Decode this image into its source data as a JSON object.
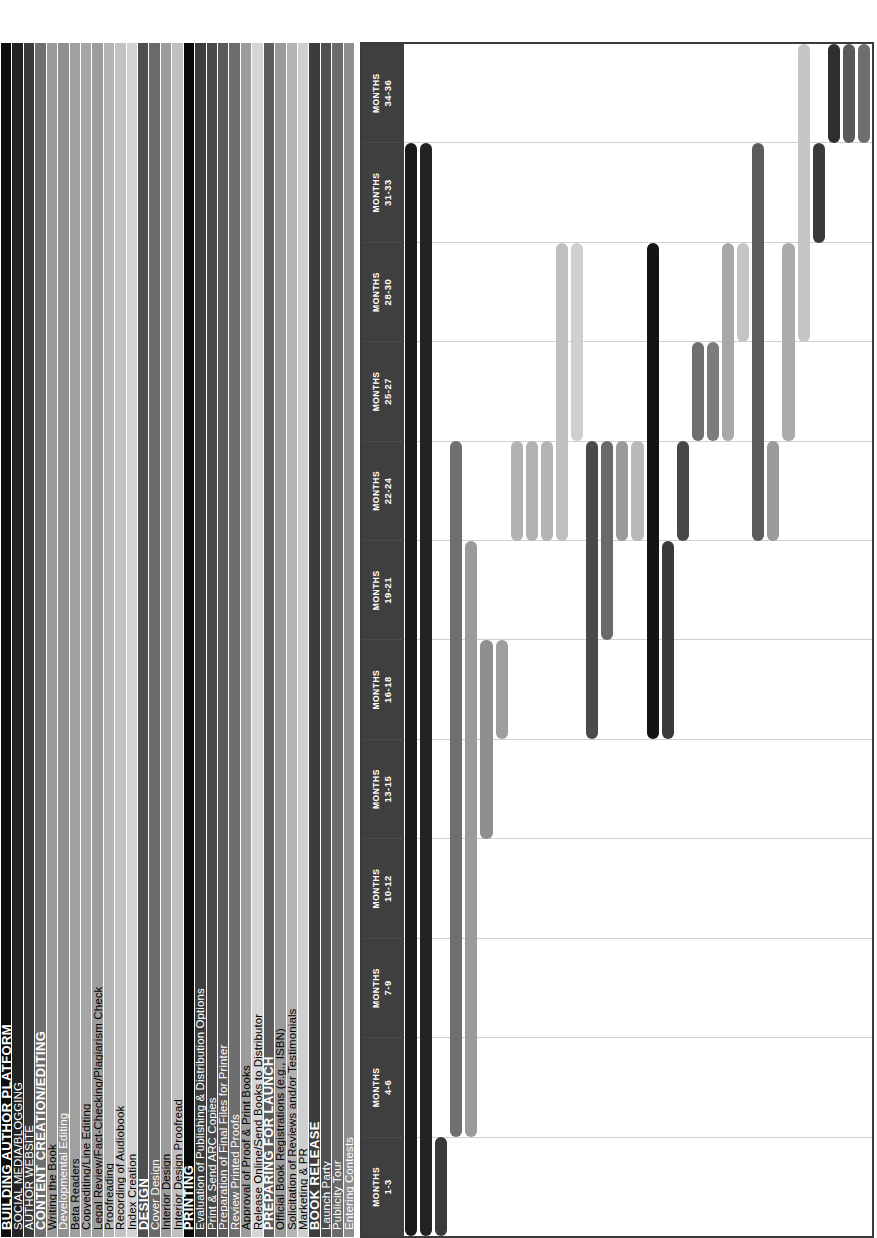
{
  "chart_data": {
    "type": "bar",
    "subtype": "gantt",
    "title": "",
    "xlabel": "",
    "ylabel": "",
    "grid": true,
    "legend": "none",
    "x_unit": "quarter",
    "x_range": [
      1,
      12
    ],
    "categories": [
      "MONTHS 1-3",
      "MONTHS 4-6",
      "MONTHS 7-9",
      "MONTHS 10-12",
      "MONTHS 13-15",
      "MONTHS 16-18",
      "MONTHS 19-21",
      "MONTHS 22-24",
      "MONTHS 25-27",
      "MONTHS 28-30",
      "MONTHS 31-33",
      "MONTHS 34-36"
    ],
    "column_headers": [
      {
        "line1": "MONTHS",
        "line2": "1-3"
      },
      {
        "line1": "MONTHS",
        "line2": "4-6"
      },
      {
        "line1": "MONTHS",
        "line2": "7-9"
      },
      {
        "line1": "MONTHS",
        "line2": "10-12"
      },
      {
        "line1": "MONTHS",
        "line2": "13-15"
      },
      {
        "line1": "MONTHS",
        "line2": "16-18"
      },
      {
        "line1": "MONTHS",
        "line2": "19-21"
      },
      {
        "line1": "MONTHS",
        "line2": "22-24"
      },
      {
        "line1": "MONTHS",
        "line2": "25-27"
      },
      {
        "line1": "MONTHS",
        "line2": "28-30"
      },
      {
        "line1": "MONTHS",
        "line2": "31-33"
      },
      {
        "line1": "MONTHS",
        "line2": "34-36"
      }
    ],
    "tasks": [
      {
        "label": "BUILDING AUTHOR PLATFORM",
        "phase": true,
        "label_bg": "#0d0d0d",
        "bar_color": "#1a1a1a",
        "start": 1,
        "end": 12
      },
      {
        "label": "SOCIAL MEDIA/BLOGGING",
        "phase": false,
        "label_bg": "#232323",
        "bar_color": "#232323",
        "start": 1,
        "end": 12
      },
      {
        "label": "AUTHOR WEBSITE",
        "phase": false,
        "label_bg": "#3a3a3a",
        "bar_color": "#3a3a3a",
        "start": 1,
        "end": 2
      },
      {
        "label": "CONTENT CREATION/EDITING",
        "phase": true,
        "label_bg": "#6f6f6f",
        "bar_color": "#6f6f6f",
        "start": 2,
        "end": 9
      },
      {
        "label": "Writing the Book",
        "phase": false,
        "label_bg": "#9b9b9b",
        "bar_color": "#9b9b9b",
        "start": 2,
        "end": 8
      },
      {
        "label": "Developmental Editing",
        "phase": false,
        "label_bg": "#8f8f8f",
        "bar_color": "#8f8f8f",
        "start": 5,
        "end": 7
      },
      {
        "label": "Beta Readers",
        "phase": false,
        "label_bg": "#a0a0a0",
        "bar_color": "#9e9e9e",
        "start": 6,
        "end": 7
      },
      {
        "label": "Copyediting/Line Editing",
        "phase": false,
        "label_bg": "#a6a6a6",
        "bar_color": "#b2b2b2",
        "start": 8,
        "end": 9
      },
      {
        "label": "Legal Review/Fact-Checking/Plagiarism Check",
        "phase": false,
        "label_bg": "#9d9d9d",
        "bar_color": "#b2b2b2",
        "start": 8,
        "end": 9
      },
      {
        "label": "Proofreading",
        "phase": false,
        "label_bg": "#b4b4b4",
        "bar_color": "#b4b4b4",
        "start": 8,
        "end": 9
      },
      {
        "label": "Recording of Audiobook",
        "phase": false,
        "label_bg": "#c2c2c2",
        "bar_color": "#c0c0c0",
        "start": 8,
        "end": 11
      },
      {
        "label": "Index Creation",
        "phase": false,
        "label_bg": "#d2d2d2",
        "bar_color": "#cfcfcf",
        "start": 9,
        "end": 11
      },
      {
        "label": "DESIGN",
        "phase": true,
        "label_bg": "#4e4e4e",
        "bar_color": "#4a4a4a",
        "start": 6,
        "end": 9
      },
      {
        "label": "Cover Design",
        "phase": false,
        "label_bg": "#6a6a6a",
        "bar_color": "#6a6a6a",
        "start": 7,
        "end": 9
      },
      {
        "label": "Interior Design",
        "phase": false,
        "label_bg": "#9c9c9c",
        "bar_color": "#9a9a9a",
        "start": 8,
        "end": 9
      },
      {
        "label": "Interior Design Proofread",
        "phase": false,
        "label_bg": "#c0c0c0",
        "bar_color": "#b9b9b9",
        "start": 8,
        "end": 9
      },
      {
        "label": "PRINTING",
        "phase": true,
        "label_bg": "#0a0a0a",
        "bar_color": "#141414",
        "start": 6,
        "end": 11
      },
      {
        "label": "Evaluation of Publishing & Distribution Options",
        "phase": false,
        "label_bg": "#3d3d3d",
        "bar_color": "#3a3a3a",
        "start": 6,
        "end": 8
      },
      {
        "label": "Print & Send ARC Copies",
        "phase": false,
        "label_bg": "#4a4a4a",
        "bar_color": "#474747",
        "start": 8,
        "end": 9
      },
      {
        "label": "Preparation of Final Files for Printer",
        "phase": false,
        "label_bg": "#5a5a5a",
        "bar_color": "#6f6f6f",
        "start": 9,
        "end": 10
      },
      {
        "label": "Review Printed Proofs",
        "phase": false,
        "label_bg": "#6e6e6e",
        "bar_color": "#7c7c7c",
        "start": 9,
        "end": 10
      },
      {
        "label": "Approval of Proof & Print Books",
        "phase": false,
        "label_bg": "#9d9d9d",
        "bar_color": "#a8a8a8",
        "start": 9,
        "end": 11
      },
      {
        "label": "Release Online/Send Books to Distributor",
        "phase": false,
        "label_bg": "#d6d6d6",
        "bar_color": "#c4c4c4",
        "start": 10,
        "end": 11
      },
      {
        "label": "PREPARING FOR LAUNCH",
        "phase": true,
        "label_bg": "#5c5c5c",
        "bar_color": "#5c5c5c",
        "start": 8,
        "end": 12
      },
      {
        "label": "Official Book Registrations (e.g., ISBN)",
        "phase": false,
        "label_bg": "#9a9a9a",
        "bar_color": "#9a9a9a",
        "start": 8,
        "end": 9
      },
      {
        "label": "Solicitation of Reviews and/or Testimonials",
        "phase": false,
        "label_bg": "#b3b3b3",
        "bar_color": "#ababab",
        "start": 9,
        "end": 11
      },
      {
        "label": "Marketing & PR",
        "phase": false,
        "label_bg": "#cfcfcf",
        "bar_color": "#c5c5c5",
        "start": 10,
        "end": 13
      },
      {
        "label": "BOOK RELEASE",
        "phase": true,
        "label_bg": "#3c3c3c",
        "bar_color": "#3a3a3a",
        "start": 11,
        "end": 12
      },
      {
        "label": "Launch Party",
        "phase": false,
        "label_bg": "#4f4f4f",
        "bar_color": "#2f2f2f",
        "start": 12,
        "end": 13
      },
      {
        "label": "Publicity Tour",
        "phase": false,
        "label_bg": "#6b6b6b",
        "bar_color": "#595959",
        "start": 12,
        "end": 13
      },
      {
        "label": "Entering Contests",
        "phase": false,
        "label_bg": "#8e8e8e",
        "bar_color": "#6e6e6e",
        "start": 12,
        "end": 13
      }
    ]
  },
  "colors": {
    "plot_border": "#3a3a3a",
    "header_band": "#3f3f3f",
    "gridline": "#d0d0d0",
    "background": "#ffffff",
    "label_text_light": "#ffffff",
    "label_text_dark": "#000000"
  }
}
